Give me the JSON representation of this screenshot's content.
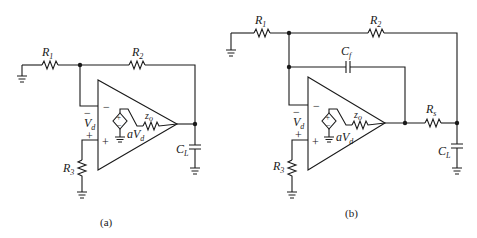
{
  "figure": {
    "panels": [
      {
        "id": "a",
        "caption": "(a)",
        "components": {
          "R1": {
            "name": "R",
            "sub": "1"
          },
          "R2": {
            "name": "R",
            "sub": "2"
          },
          "R3": {
            "name": "R",
            "sub": "3"
          },
          "CL": {
            "name": "C",
            "sub": "L"
          },
          "zo": {
            "name": "z",
            "sub": "o"
          },
          "Vd": {
            "name": "V",
            "sub": "d"
          },
          "source": {
            "name": "aV",
            "sub": "d"
          }
        },
        "signs": {
          "inv": "−",
          "noninv": "+",
          "vd_top": "−",
          "vd_bottom": "+",
          "src_top": "+",
          "src_bottom": "−"
        }
      },
      {
        "id": "b",
        "caption": "(b)",
        "components": {
          "R1": {
            "name": "R",
            "sub": "1"
          },
          "R2": {
            "name": "R",
            "sub": "2"
          },
          "R3": {
            "name": "R",
            "sub": "3"
          },
          "Rs": {
            "name": "R",
            "sub": "s"
          },
          "Cf": {
            "name": "C",
            "sub": "f"
          },
          "CL": {
            "name": "C",
            "sub": "L"
          },
          "zo": {
            "name": "z",
            "sub": "o"
          },
          "Vd": {
            "name": "V",
            "sub": "d"
          },
          "source": {
            "name": "aV",
            "sub": "d"
          }
        },
        "signs": {
          "inv": "−",
          "noninv": "+",
          "vd_top": "−",
          "vd_bottom": "+",
          "src_top": "+",
          "src_bottom": "−"
        }
      }
    ]
  }
}
